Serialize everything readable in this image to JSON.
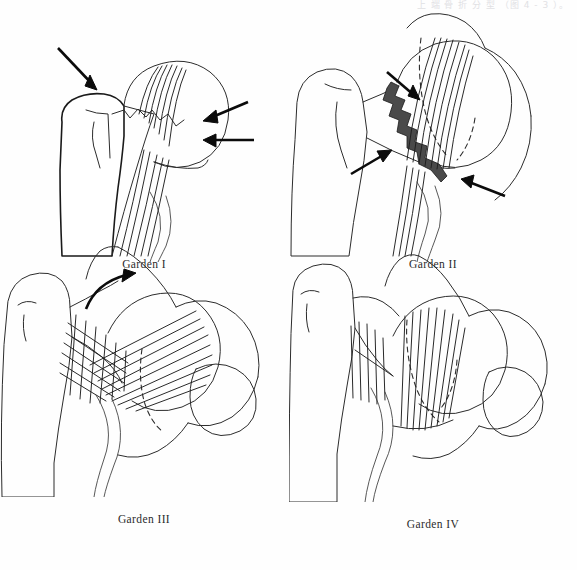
{
  "page": {
    "width": 577,
    "height": 570,
    "background_color": "#fefefe",
    "header_text_fragment": "上 端 骨 折 分 型 （图 4 - 3 ）。"
  },
  "figure": {
    "title_implied": "Garden classification of femoral neck fractures",
    "layout": "2x2 grid of line-art anatomical illustrations",
    "line_color": "#1a1a1a",
    "fracture_line_color": "#4a4a4a",
    "arrow_color": "#0b0b0b"
  },
  "panels": [
    {
      "id": "garden-1",
      "caption": "Garden I",
      "grid_position": "top-left",
      "description": "Incomplete / impacted valgus fracture of the femoral neck",
      "arrow_count": 3,
      "arrows": [
        {
          "name": "arrow-superior",
          "direction": "down-right"
        },
        {
          "name": "arrow-lateral-upper",
          "direction": "left-down"
        },
        {
          "name": "arrow-lateral-lower",
          "direction": "left"
        }
      ],
      "has_dashed_outline": false,
      "has_fracture_band": false,
      "has_crosshatch": false,
      "trabeculae": "intact fanning trabecular lines in femoral head"
    },
    {
      "id": "garden-2",
      "caption": "Garden II",
      "grid_position": "top-right",
      "description": "Complete fracture without displacement",
      "arrow_count": 3,
      "arrows": [
        {
          "name": "arrow-upper",
          "direction": "down-right"
        },
        {
          "name": "arrow-middle",
          "direction": "up-right"
        },
        {
          "name": "arrow-lower",
          "direction": "left"
        }
      ],
      "has_dashed_outline": true,
      "has_fracture_band": true,
      "has_crosshatch": false,
      "trabeculae": "trabecular lines continuous across non-displaced fracture"
    },
    {
      "id": "garden-3",
      "caption": "Garden III",
      "grid_position": "bottom-left",
      "description": "Complete fracture with partial displacement and varus rotation of the head",
      "arrow_count": 1,
      "arrows": [
        {
          "name": "arrow-rotation",
          "direction": "curved up-right"
        }
      ],
      "has_dashed_outline": true,
      "has_fracture_band": false,
      "has_crosshatch": true,
      "trabeculae": "trabecular lines malaligned; crosshatched disruption zone at neck"
    },
    {
      "id": "garden-4",
      "caption": "Garden IV",
      "grid_position": "bottom-right",
      "description": "Complete fracture with total displacement",
      "arrow_count": 0,
      "arrows": [],
      "has_dashed_outline": true,
      "has_fracture_band": false,
      "has_crosshatch": false,
      "trabeculae": "trabecular lines of head realigned parallel to acetabulum; full separation"
    }
  ]
}
